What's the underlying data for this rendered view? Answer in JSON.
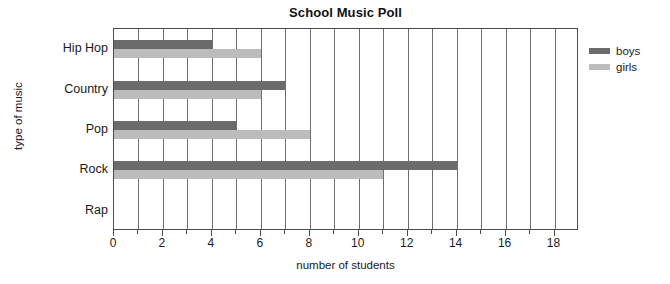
{
  "chart_data": {
    "type": "bar",
    "orientation": "horizontal",
    "title": "School Music Poll",
    "xlabel": "number of students",
    "ylabel": "type of music",
    "categories": [
      "Hip Hop",
      "Country",
      "Pop",
      "Rock",
      "Rap"
    ],
    "series": [
      {
        "name": "boys",
        "color": "#6b6b6b",
        "values": [
          4,
          7,
          5,
          14,
          0
        ]
      },
      {
        "name": "girls",
        "color": "#bcbcbc",
        "values": [
          6,
          6,
          8,
          11,
          0
        ]
      }
    ],
    "xlim": [
      0,
      19
    ],
    "xticks": [
      0,
      2,
      4,
      6,
      8,
      10,
      12,
      14,
      16,
      18
    ],
    "xticklabels": [
      "0",
      "2",
      "4",
      "6",
      "8",
      "10",
      "12",
      "14",
      "16",
      "18"
    ],
    "gridlines": [
      1,
      2,
      3,
      4,
      5,
      6,
      7,
      8,
      9,
      10,
      11,
      12,
      13,
      14,
      15,
      16,
      17,
      18
    ],
    "grid": true,
    "legend_position": "right",
    "axis_color": "#4a4a4a",
    "grid_color": "#6e6e6e",
    "background": "#ffffff"
  }
}
